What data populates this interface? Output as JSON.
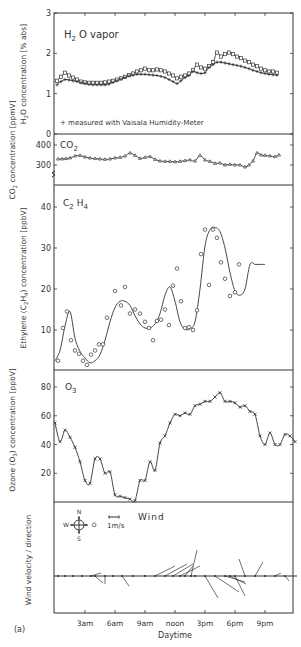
{
  "figure_label": "(a)",
  "x_axis": {
    "label": "Daytime",
    "ticks": [
      {
        "hour": 3,
        "label": "3am"
      },
      {
        "hour": 6,
        "label": "6am"
      },
      {
        "hour": 9,
        "label": "9am"
      },
      {
        "hour": 12,
        "label": "noon"
      },
      {
        "hour": 15,
        "label": "3pm"
      },
      {
        "hour": 18,
        "label": "6pm"
      },
      {
        "hour": 21,
        "label": "9pm"
      }
    ]
  },
  "panels": {
    "h2o": {
      "title": "H2O vapor",
      "title_main": "H",
      "title_sub": "2",
      "title_rest": "O  vapor",
      "ylabel": "H2O concentration [% abs]",
      "yticks": [
        "0",
        "1",
        "2",
        "3"
      ],
      "note": "+ measured with Vaisala Humidity-Meter"
    },
    "co2": {
      "title": "CO2",
      "ylabel": "CO2 concentration [ppmV]",
      "yticks": [
        "300",
        "400"
      ]
    },
    "c2h4": {
      "title": "C2H4",
      "ylabel": "Ethylene (C2H4) concentration [ppbV]",
      "yticks": [
        "10",
        "20",
        "30",
        "40"
      ]
    },
    "o3": {
      "title": "O3",
      "ylabel": "Ozone (O3) concentration [ppbV]",
      "yticks": [
        "20",
        "40",
        "60",
        "80"
      ]
    },
    "wind": {
      "title": "Wind",
      "ylabel": "Wind velocity / direction",
      "compass": {
        "n": "N",
        "s": "S",
        "w": "W",
        "e": "O"
      },
      "scale_label": "1m/s"
    }
  },
  "chart_data": [
    {
      "type": "scatter",
      "title": "H2O vapor",
      "ylabel": "H2O concentration [% abs]",
      "xlabel": "Daytime",
      "ylim": [
        0,
        3
      ],
      "series": [
        {
          "name": "open squares (spectroscopic)",
          "marker": "square",
          "x": [
            0.2,
            0.6,
            1.0,
            1.4,
            1.8,
            2.2,
            2.6,
            3.0,
            3.4,
            3.8,
            4.2,
            4.6,
            5.0,
            5.4,
            5.8,
            6.2,
            6.6,
            7.0,
            7.4,
            7.8,
            8.2,
            8.6,
            9.0,
            9.4,
            9.8,
            10.2,
            10.6,
            11.0,
            11.4,
            11.8,
            12.2,
            12.6,
            13.0,
            13.4,
            13.8,
            14.2,
            14.6,
            15.0,
            15.4,
            15.8,
            16.2,
            16.6,
            17.0,
            17.4,
            17.8,
            18.2,
            18.6,
            19.0,
            19.4,
            19.8,
            20.2,
            20.6,
            21.0,
            21.4,
            21.8,
            22.2
          ],
          "y": [
            1.32,
            1.42,
            1.52,
            1.45,
            1.4,
            1.35,
            1.3,
            1.28,
            1.27,
            1.27,
            1.27,
            1.27,
            1.28,
            1.3,
            1.32,
            1.35,
            1.38,
            1.42,
            1.46,
            1.5,
            1.55,
            1.58,
            1.62,
            1.58,
            1.58,
            1.6,
            1.58,
            1.55,
            1.5,
            1.45,
            1.38,
            1.42,
            1.45,
            1.5,
            1.58,
            1.72,
            1.65,
            1.62,
            1.68,
            1.78,
            2.02,
            1.92,
            1.98,
            2.02,
            1.98,
            1.92,
            1.88,
            1.82,
            1.78,
            1.72,
            1.68,
            1.62,
            1.58,
            1.55,
            1.55,
            1.52
          ]
        },
        {
          "name": "+ measured with Vaisala Humidity-Meter",
          "marker": "plus",
          "x": [
            0.2,
            0.6,
            1.0,
            1.4,
            1.8,
            2.2,
            2.6,
            3.0,
            3.4,
            3.8,
            4.2,
            4.6,
            5.0,
            5.4,
            5.8,
            6.2,
            6.6,
            7.0,
            7.4,
            7.8,
            8.2,
            8.6,
            9.0,
            9.4,
            9.8,
            10.2,
            10.6,
            11.0,
            11.4,
            11.8,
            12.2,
            12.6,
            13.0,
            13.4,
            13.8,
            14.2,
            14.6,
            15.0,
            15.4,
            15.8,
            16.2,
            16.6,
            17.0,
            17.4,
            17.8,
            18.2,
            18.6,
            19.0,
            19.4,
            19.8,
            20.2,
            20.6,
            21.0,
            21.4,
            21.8,
            22.2
          ],
          "y": [
            1.22,
            1.3,
            1.35,
            1.34,
            1.32,
            1.3,
            1.27,
            1.25,
            1.23,
            1.22,
            1.22,
            1.22,
            1.22,
            1.24,
            1.28,
            1.32,
            1.36,
            1.4,
            1.44,
            1.46,
            1.48,
            1.48,
            1.48,
            1.47,
            1.46,
            1.45,
            1.43,
            1.4,
            1.35,
            1.3,
            1.25,
            1.32,
            1.4,
            1.45,
            1.55,
            1.52,
            1.5,
            1.52,
            1.65,
            1.72,
            1.78,
            1.78,
            1.76,
            1.74,
            1.72,
            1.7,
            1.68,
            1.65,
            1.62,
            1.58,
            1.55,
            1.52,
            1.5,
            1.48,
            1.47,
            1.46
          ]
        }
      ]
    },
    {
      "type": "line",
      "title": "CO2",
      "ylabel": "CO2 concentration [ppmV]",
      "ylim": [
        200,
        450
      ],
      "series": [
        {
          "name": "CO2",
          "marker": "triangle",
          "x": [
            0.3,
            0.7,
            1.1,
            1.5,
            2.0,
            2.5,
            3.0,
            3.5,
            4.0,
            4.5,
            5.0,
            5.5,
            6.0,
            6.5,
            7.0,
            7.5,
            8.0,
            8.5,
            9.0,
            9.5,
            10.0,
            10.5,
            11.0,
            11.5,
            12.0,
            12.5,
            13.0,
            13.5,
            14.0,
            14.5,
            15.0,
            15.5,
            16.0,
            16.5,
            17.0,
            17.5,
            18.0,
            18.5,
            19.0,
            19.4,
            19.8,
            20.2,
            20.6,
            21.0,
            21.5,
            22.0,
            22.4
          ],
          "y": [
            330,
            330,
            332,
            335,
            345,
            348,
            340,
            335,
            332,
            330,
            328,
            330,
            335,
            338,
            345,
            360,
            348,
            333,
            338,
            342,
            328,
            320,
            318,
            318,
            316,
            318,
            322,
            325,
            320,
            348,
            325,
            318,
            308,
            310,
            300,
            303,
            300,
            300,
            290,
            300,
            320,
            360,
            350,
            348,
            345,
            342,
            350
          ]
        }
      ]
    },
    {
      "type": "scatter",
      "title": "C2H4",
      "ylabel": "Ethylene (C2H4) concentration [ppbV]",
      "ylim": [
        0,
        45
      ],
      "series": [
        {
          "name": "C2H4 measured",
          "marker": "circle",
          "x": [
            0.3,
            0.8,
            1.2,
            1.6,
            2.0,
            2.4,
            2.8,
            3.2,
            3.6,
            4.0,
            4.4,
            4.8,
            5.2,
            6.0,
            6.6,
            7.0,
            7.5,
            8.0,
            8.5,
            9.0,
            9.4,
            9.8,
            10.2,
            10.6,
            11.0,
            11.4,
            11.8,
            12.2,
            12.6,
            13.0,
            13.4,
            13.8,
            14.2,
            14.6,
            15.0,
            15.4,
            15.8,
            16.2,
            16.6,
            17.0,
            17.5,
            18.0,
            18.4,
            18.8,
            19.2,
            19.6,
            20.0,
            20.4,
            20.8
          ],
          "y": [
            2.5,
            10.5,
            14.5,
            7.5,
            5,
            4.2,
            2.5,
            1.5,
            4,
            5,
            6.5,
            6.5,
            13,
            19.5,
            16,
            20.5,
            14,
            15,
            14,
            12,
            10.5,
            7.5,
            12.2,
            12.5,
            15,
            11.2,
            20.8,
            25,
            17,
            10.5,
            10.7,
            10,
            14.8,
            28.5,
            34.5,
            21,
            34.5,
            32.5,
            26.5,
            22.5,
            18.3,
            19.2,
            26
          ]
        },
        {
          "name": "smooth fit",
          "marker": "none",
          "x": [
            0,
            0.5,
            1.0,
            1.5,
            2.0,
            2.5,
            3.0,
            3.5,
            4.0,
            4.5,
            5.0,
            5.5,
            6.0,
            6.5,
            7.0,
            7.5,
            8.0,
            8.5,
            9.0,
            9.5,
            10.0,
            10.5,
            11.0,
            11.5,
            12.0,
            12.5,
            13.0,
            13.5,
            14.0,
            14.5,
            15.0,
            15.5,
            16.0,
            16.5,
            17.0,
            17.5,
            18.0,
            18.5,
            19.0,
            19.5,
            20.0,
            20.5,
            21.0
          ],
          "y": [
            2.5,
            5,
            11,
            14.5,
            8,
            4.8,
            3.2,
            2,
            2.5,
            4,
            7.5,
            12,
            15.5,
            17,
            17,
            16,
            13.5,
            11.5,
            10.5,
            10.5,
            11.5,
            14,
            18.5,
            20.5,
            17,
            12,
            10.2,
            10.3,
            12,
            20,
            30.5,
            34.5,
            35,
            34,
            30,
            24,
            19.5,
            18.5,
            20,
            26,
            26,
            26,
            26
          ]
        }
      ]
    },
    {
      "type": "scatter",
      "title": "O3",
      "ylabel": "Ozone (O3) concentration [ppbV]",
      "ylim": [
        0,
        92
      ],
      "series": [
        {
          "name": "O3",
          "marker": "cross",
          "x": [
            0.0,
            0.5,
            1.0,
            1.5,
            2.0,
            2.5,
            3.0,
            3.5,
            4.0,
            4.5,
            5.0,
            5.5,
            6.0,
            6.5,
            7.0,
            7.5,
            8.0,
            8.5,
            9.0,
            9.5,
            10.0,
            10.5,
            11.0,
            11.5,
            12.0,
            12.5,
            13.0,
            13.5,
            14.0,
            14.5,
            15.0,
            15.5,
            16.0,
            16.5,
            17.0,
            17.5,
            18.0,
            18.5,
            19.0,
            19.5,
            20.0,
            20.5,
            21.0,
            21.5,
            22.0,
            22.5,
            23.0,
            23.5,
            24.0
          ],
          "y": [
            55,
            42,
            50,
            45,
            38,
            28,
            15,
            13,
            30,
            30,
            20,
            21,
            5,
            4,
            3,
            2,
            1,
            15,
            15,
            28,
            22,
            41,
            46,
            55,
            61,
            60,
            62,
            61,
            67,
            68,
            70,
            70,
            73,
            76,
            70,
            70,
            69,
            66,
            67,
            63,
            61,
            46,
            40,
            48,
            40,
            40,
            47,
            46,
            42
          ]
        }
      ]
    },
    {
      "type": "vector",
      "title": "Wind",
      "ylabel": "Wind velocity / direction",
      "note": "Stick diagram: each stick starts on baseline; length = speed, orientation = direction (N up, O/East right). Scale bar = 1 m/s.",
      "series": [
        {
          "name": "wind sticks (dx,dy in m/s, +dy = north)",
          "x": [
            0.3,
            1.0,
            1.8,
            2.7,
            3.6,
            4.0,
            5.0,
            5.8,
            6.7,
            7.8,
            9.0,
            10.0,
            11.0,
            11.8,
            12.5,
            13.0,
            13.6,
            14.0,
            15.0,
            16.0,
            17.0,
            17.5,
            18.0,
            19.0,
            20.0,
            21.0,
            22.0,
            23.0
          ],
          "dx": [
            0,
            0,
            0,
            0,
            1.0,
            0.8,
            0,
            0,
            0.7,
            0,
            0,
            2.0,
            2.2,
            2.0,
            2.0,
            0.8,
            0.6,
            0,
            1.3,
            2.4,
            2.0,
            1.6,
            1.0,
            -0.6,
            0.8,
            0,
            0.6,
            0.4
          ],
          "dy": [
            0,
            0,
            0,
            0,
            0.3,
            -0.7,
            -0.8,
            0,
            -1.0,
            0,
            0.1,
            1.0,
            1.2,
            1.2,
            1.0,
            1.0,
            2.6,
            0,
            -2.2,
            -1.6,
            -0.6,
            -0.8,
            -2.0,
            1.7,
            1.4,
            0,
            0.3,
            -0.5
          ]
        }
      ]
    }
  ]
}
